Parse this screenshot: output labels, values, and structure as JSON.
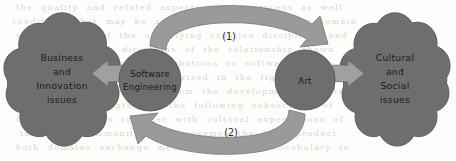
{
  "diagram": {
    "canvas": {
      "width": 456,
      "height": 161
    },
    "colors": {
      "node_fill": "#6e6e6e",
      "node_stroke": "#4a4a4a",
      "curved_arrow_fill": "#9a9a9a",
      "curved_arrow_stroke": "#787878",
      "block_arrow_fill": "#a0a0a0",
      "block_arrow_stroke": "#6d6d6d",
      "background": "#fdfdfc",
      "label_text": "#1b1b1b"
    },
    "nodes": [
      {
        "id": "business-cloud",
        "shape": "cloud",
        "lines": [
          "Business",
          "and",
          "Innovation",
          "issues"
        ],
        "cx": 62,
        "cy": 80
      },
      {
        "id": "software-engineering",
        "shape": "circle",
        "lines": [
          "Software",
          "Engineering"
        ],
        "cx": 150,
        "cy": 80,
        "r": 31
      },
      {
        "id": "art",
        "shape": "circle",
        "lines": [
          "Art"
        ],
        "cx": 305,
        "cy": 80,
        "r": 30
      },
      {
        "id": "cultural-cloud",
        "shape": "cloud",
        "lines": [
          "Cultural",
          "and",
          "Social",
          "issues"
        ],
        "cx": 395,
        "cy": 80
      }
    ],
    "curved_arrows": [
      {
        "id": "arrow-1",
        "label": "(1)",
        "label_x": 229,
        "label_y": 37,
        "direction": "left-to-right",
        "from": "software-engineering",
        "to": "art"
      },
      {
        "id": "arrow-2",
        "label": "(2)",
        "label_x": 231,
        "label_y": 133,
        "direction": "right-to-left",
        "from": "art",
        "to": "software-engineering"
      }
    ],
    "block_arrows": [
      {
        "id": "arrow-to-business",
        "direction": "left",
        "from": "software-engineering",
        "to": "business-cloud"
      },
      {
        "id": "arrow-to-cultural",
        "direction": "right",
        "from": "art",
        "to": "cultural-cloud"
      }
    ],
    "background_ghost_text": [
      "  the  quality  and  related  aspects  of  the  process  as  well  ",
      " conditions  that  may  be  applied  to  the  engineering  domain ",
      "  understanding  of  the  underlying  creative  disciplines  and  ",
      "   practice  in  both  directions  of  the  relationship  shown   ",
      "  evaluation  of  artistic  contributions  to  software  design   ",
      "   these  influences  are  summarised  in  the  figure  below     ",
      "  and  social  issues  arising  from  the  development  process   ",
      "   considered  separately  in  the  following  subsections  of    ",
      "  innovation  issues  together  with  cultural  expectations  of  ",
      "   the  wider  community  that  consumes  the  final  product     ",
      "  both  domains  exchange  methods  ideas  and  vocabulary  in    "
    ]
  }
}
